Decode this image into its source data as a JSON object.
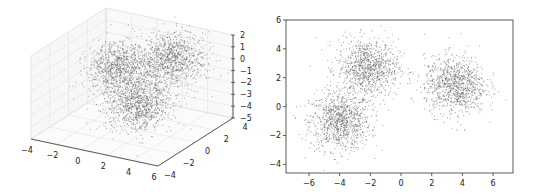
{
  "chart_data": [
    {
      "type": "scatter",
      "title": "",
      "projection": "3d",
      "xlabel": "",
      "ylabel": "",
      "zlabel": "",
      "xlim": [
        -4,
        6
      ],
      "ylim": [
        -4,
        4
      ],
      "zlim": [
        -5,
        2
      ],
      "xticks": [
        "−4",
        "−2",
        "0",
        "2",
        "4",
        "6"
      ],
      "yticks": [
        "−4",
        "−2",
        "0",
        "2",
        "4"
      ],
      "zticks": [
        "2",
        "1",
        "0",
        "−1",
        "−2",
        "−3",
        "−4",
        "−5"
      ],
      "grid": true,
      "marker_color": "#555555",
      "series": [
        {
          "name": "cluster-1",
          "center": [
            -1.5,
            2.0,
            -1.5
          ],
          "std": 1.0,
          "n": 1000
        },
        {
          "name": "cluster-2",
          "center": [
            3.0,
            1.5,
            0.5
          ],
          "std": 1.0,
          "n": 1000
        },
        {
          "name": "cluster-3",
          "center": [
            3.0,
            -2.0,
            -1.5
          ],
          "std": 1.0,
          "n": 1000
        }
      ]
    },
    {
      "type": "scatter",
      "title": "",
      "xlabel": "",
      "ylabel": "",
      "xlim": [
        -7.5,
        7.3
      ],
      "ylim": [
        -4.6,
        6.0
      ],
      "xticks": [
        "−6",
        "−4",
        "−2",
        "0",
        "2",
        "4",
        "6"
      ],
      "yticks": [
        "6",
        "4",
        "2",
        "0",
        "−2",
        "−4"
      ],
      "grid": false,
      "marker_color": "#555555",
      "series": [
        {
          "name": "cluster-1",
          "center": [
            -4.0,
            -1.0
          ],
          "std": 1.0,
          "n": 1000
        },
        {
          "name": "cluster-2",
          "center": [
            -2.2,
            2.7
          ],
          "std": 1.0,
          "n": 1000
        },
        {
          "name": "cluster-3",
          "center": [
            3.5,
            1.5
          ],
          "std": 1.0,
          "n": 1000
        }
      ]
    }
  ]
}
